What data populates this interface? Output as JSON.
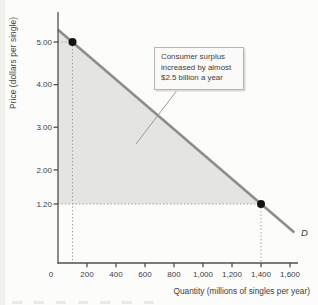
{
  "page": {
    "background": "#fcfcfb"
  },
  "chart_data": {
    "type": "line",
    "title": "",
    "xlabel": "Quantity (millions of singles per year)",
    "ylabel": "Price (dollars per single)",
    "xlim": [
      0,
      1655
    ],
    "ylim": [
      0,
      5.9
    ],
    "grid": false,
    "legend": false,
    "x_ticks": [
      {
        "value": 0,
        "label": "0"
      },
      {
        "value": 200,
        "label": "200"
      },
      {
        "value": 400,
        "label": "400"
      },
      {
        "value": 600,
        "label": "600"
      },
      {
        "value": 800,
        "label": "800"
      },
      {
        "value": 1000,
        "label": "1,000"
      },
      {
        "value": 1200,
        "label": "1,200"
      },
      {
        "value": 1400,
        "label": "1,400"
      },
      {
        "value": 1600,
        "label": "1,600"
      }
    ],
    "y_ticks": [
      {
        "value": 5.0,
        "label": "5.00"
      },
      {
        "value": 4.0,
        "label": "4.00"
      },
      {
        "value": 3.0,
        "label": "3.00"
      },
      {
        "value": 2.0,
        "label": "2.00"
      },
      {
        "value": 1.2,
        "label": "1.20"
      }
    ],
    "series": [
      {
        "name": "D",
        "type": "line",
        "color": "#8d8d8d",
        "points": [
          [
            0,
            5.29
          ],
          [
            1630,
            0.53
          ]
        ]
      }
    ],
    "marked_points": [
      {
        "quantity": 100,
        "price": 5.0
      },
      {
        "quantity": 1400,
        "price": 1.2
      }
    ],
    "shaded_area": {
      "name": "consumer-surplus",
      "color": "#e4e4e2",
      "vertices": [
        [
          0,
          5.29
        ],
        [
          1400,
          1.2
        ],
        [
          0,
          1.2
        ]
      ]
    },
    "annotation": {
      "text": "Consumer surplus increased by almost $2.5 billion a year"
    },
    "point_color": "#141414",
    "axis_color": "#4f4f4f",
    "guide_line_color": "#9b9b9b"
  }
}
